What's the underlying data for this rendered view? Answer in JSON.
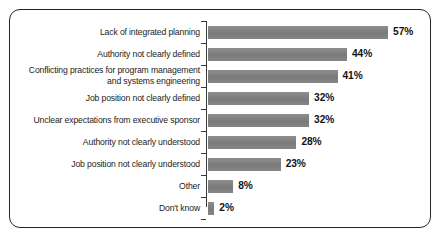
{
  "chart_data": {
    "type": "bar",
    "orientation": "horizontal",
    "title": "",
    "subtitle": "",
    "xlabel": "",
    "ylabel": "",
    "xlim": [
      0,
      60
    ],
    "grid": false,
    "legend": null,
    "value_suffix": "%",
    "categories": [
      "Lack of integrated planning",
      "Authority not clearly defined",
      "Conflicting practices for program management and systems engineering",
      "Job position not clearly defined",
      "Unclear expectations from executive sponsor",
      "Authority not clearly understood",
      "Job position not clearly understood",
      "Other",
      "Don't know"
    ],
    "values": [
      57,
      44,
      41,
      32,
      32,
      28,
      23,
      8,
      2
    ],
    "data_labels": [
      "57%",
      "44%",
      "41%",
      "32%",
      "32%",
      "28%",
      "23%",
      "8%",
      "2%"
    ],
    "bars": [
      {
        "label_lines": [
          "Lack of integrated planning"
        ],
        "value": 57,
        "data_label": "57%"
      },
      {
        "label_lines": [
          "Authority not clearly defined"
        ],
        "value": 44,
        "data_label": "44%"
      },
      {
        "label_lines": [
          "Conflicting practices for program management",
          "and systems engineering"
        ],
        "value": 41,
        "data_label": "41%"
      },
      {
        "label_lines": [
          "Job position not clearly defined"
        ],
        "value": 32,
        "data_label": "32%"
      },
      {
        "label_lines": [
          "Unclear expectations from executive sponsor"
        ],
        "value": 32,
        "data_label": "32%"
      },
      {
        "label_lines": [
          "Authority not clearly understood"
        ],
        "value": 28,
        "data_label": "28%"
      },
      {
        "label_lines": [
          "Job position not clearly understood"
        ],
        "value": 23,
        "data_label": "23%"
      },
      {
        "label_lines": [
          "Other"
        ],
        "value": 8,
        "data_label": "8%"
      },
      {
        "label_lines": [
          "Don't know"
        ],
        "value": 2,
        "data_label": "2%"
      }
    ],
    "colors": {
      "bar_fill": "#818181",
      "axis": "#3a3a3a",
      "frame_border": "#262626",
      "label_text": "#1c1c1c",
      "value_text": "#131313",
      "background": "#ffffff"
    }
  }
}
